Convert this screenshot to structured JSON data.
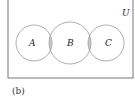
{
  "diagram": {
    "type": "venn",
    "universe_label": "U",
    "sets": [
      {
        "label": "A",
        "cx": 34,
        "cy": 43,
        "r": 18
      },
      {
        "label": "B",
        "cx": 70,
        "cy": 43,
        "r": 21
      },
      {
        "label": "C",
        "cx": 106,
        "cy": 43,
        "r": 18
      }
    ],
    "shaded_regions": [
      "A∩B",
      "B∩C"
    ],
    "colors": {
      "shade": "#cccccc",
      "stroke": "#999999",
      "frame": "#777777"
    },
    "caption": "(b)"
  }
}
